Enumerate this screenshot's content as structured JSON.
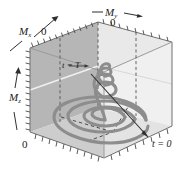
{
  "figure": {
    "name": "magnetization-precession-3d-plot",
    "axes": {
      "x": {
        "label": "M",
        "subscript": "x",
        "origin_tick": "0",
        "arrow": "up-right"
      },
      "y": {
        "label": "M",
        "subscript": "y",
        "origin_tick": "0",
        "arrow": "right"
      },
      "z": {
        "label": "M",
        "subscript": "z",
        "origin_tick": "0",
        "arrow": "up"
      }
    },
    "annotations": [
      {
        "name": "t-equals-tau",
        "text": "t = T"
      },
      {
        "name": "t-equals-zero",
        "text": "t = 0"
      }
    ],
    "colors": {
      "curve": "#8a8a8a",
      "left_wall": "#b9b9b9",
      "back_wall": "#dcdcdc",
      "floor": "#cfcfcf",
      "right_wall": "#f2f2f2",
      "edge": "#6e6e6e",
      "text": "#1c1c1c"
    }
  }
}
